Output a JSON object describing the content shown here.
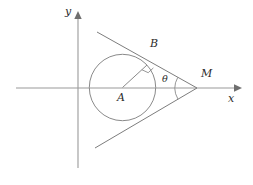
{
  "figure": {
    "background": "#ffffff",
    "stroke_color": "#8a8a8a",
    "label_color": "#2b2b2b",
    "width": 253,
    "height": 185
  },
  "axes": {
    "x_axis": {
      "label": "x",
      "label_x": 229,
      "label_y": 95,
      "y": 88,
      "x_start": 16,
      "x_end": 241,
      "arrow": "right-arrow"
    },
    "y_axis": {
      "label": "y",
      "label_x": 65,
      "label_y": 8,
      "x": 78,
      "y_start": 168,
      "y_end": 13,
      "arrow": "up-arrow"
    }
  },
  "circle": {
    "name": "circle-A",
    "center_label": "A",
    "center_x": 122.5,
    "center_y": 87.5,
    "radius": 33.2,
    "center_label_x": 116,
    "center_label_y": 92
  },
  "points": {
    "B": {
      "label": "B",
      "x": 147.0,
      "y": 65.0,
      "label_x": 150,
      "label_y": 44
    },
    "M": {
      "label": "M",
      "x": 197.0,
      "y": 88.0,
      "label_x": 202,
      "label_y": 74
    },
    "A": {
      "label": "A",
      "x": 122.5,
      "y": 87.5
    }
  },
  "angle": {
    "label": "θ",
    "label_x": 163,
    "label_y": 72,
    "vertex": "M",
    "arc_radius": 22
  },
  "markers": {
    "right_angle_at_B": true,
    "radius_segment": "A-B"
  },
  "tangent_lines": {
    "upper": {
      "x1": 97,
      "y1": 32,
      "x2": 197,
      "y2": 88
    },
    "lower": {
      "x1": 95,
      "y1": 148,
      "x2": 197,
      "y2": 88
    }
  }
}
